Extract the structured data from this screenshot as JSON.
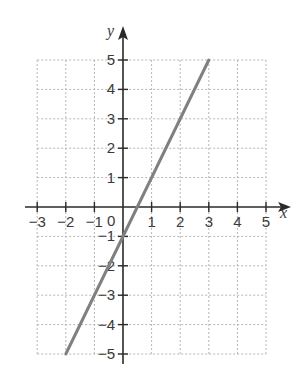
{
  "chart_data": {
    "type": "line",
    "title": "",
    "xlabel": "x",
    "ylabel": "y",
    "xlim": [
      -3,
      5
    ],
    "ylim": [
      -5,
      5
    ],
    "grid": true,
    "grid_style": "dashed",
    "x_ticks": [
      -3,
      -2,
      -1,
      0,
      1,
      2,
      3,
      4,
      5
    ],
    "y_ticks": [
      -5,
      -4,
      -3,
      -2,
      -1,
      1,
      2,
      3,
      4,
      5
    ],
    "x_tick_labels": [
      "−3",
      "−2",
      "−1",
      "1",
      "2",
      "3",
      "4",
      "5"
    ],
    "y_tick_labels": [
      "5",
      "4",
      "3",
      "2",
      "1",
      "−1",
      "−2",
      "−3",
      "−4",
      "−5"
    ],
    "origin_label": "0",
    "series": [
      {
        "name": "y = 2x − 1",
        "x": [
          -2,
          3
        ],
        "y": [
          -5,
          5
        ],
        "color": "#808080"
      }
    ],
    "colors": {
      "axis": "#2a2a2a",
      "grid": "#b5b5b5",
      "line": "#808080",
      "text": "#3a3a3a"
    }
  }
}
